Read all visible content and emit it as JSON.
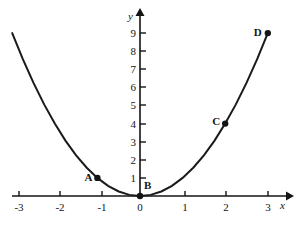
{
  "chart_data": {
    "type": "line",
    "title": "",
    "subtitle": "",
    "xlabel": "x",
    "ylabel": "y",
    "function": "y = x^2",
    "xlim": [
      -3,
      3
    ],
    "ylim": [
      0,
      9
    ],
    "grid": false,
    "legend": "none",
    "x_ticks": [
      -3,
      -2,
      -1,
      0,
      1,
      2,
      3
    ],
    "x_tick_labels": [
      "-3",
      "-2",
      "-1",
      "0",
      "1",
      "2",
      "3"
    ],
    "y_ticks": [
      1,
      2,
      3,
      4,
      5,
      6,
      7,
      8,
      9
    ],
    "y_tick_labels": [
      "1",
      "2",
      "3",
      "4",
      "5",
      "6",
      "7",
      "8",
      "9"
    ],
    "series": [
      {
        "name": "y = x^2",
        "x": [
          -3,
          -2.75,
          -2.5,
          -2.25,
          -2,
          -1.75,
          -1.5,
          -1.25,
          -1,
          -0.75,
          -0.5,
          -0.25,
          0,
          0.25,
          0.5,
          0.75,
          1,
          1.25,
          1.5,
          1.75,
          2,
          2.25,
          2.5,
          2.75,
          3
        ],
        "values": [
          9,
          7.5625,
          6.25,
          5.0625,
          4,
          3.0625,
          2.25,
          1.5625,
          1,
          0.5625,
          0.25,
          0.0625,
          0,
          0.0625,
          0.25,
          0.5625,
          1,
          1.5625,
          2.25,
          3.0625,
          4,
          5.0625,
          6.25,
          7.5625,
          9
        ]
      }
    ],
    "points": [
      {
        "label": "A",
        "x": -1,
        "y": 1,
        "label_dx": -13,
        "label_dy": -1
      },
      {
        "label": "B",
        "x": 0,
        "y": 0,
        "label_dx": 4,
        "label_dy": -11
      },
      {
        "label": "C",
        "x": 2,
        "y": 4,
        "label_dx": -13,
        "label_dy": -3
      },
      {
        "label": "D",
        "x": 3,
        "y": 9,
        "label_dx": -14,
        "label_dy": -1
      }
    ],
    "colors": {
      "curve": "#1a1a1a",
      "axis": "#141414",
      "marker": "#141414",
      "background": "#ffffff"
    }
  }
}
